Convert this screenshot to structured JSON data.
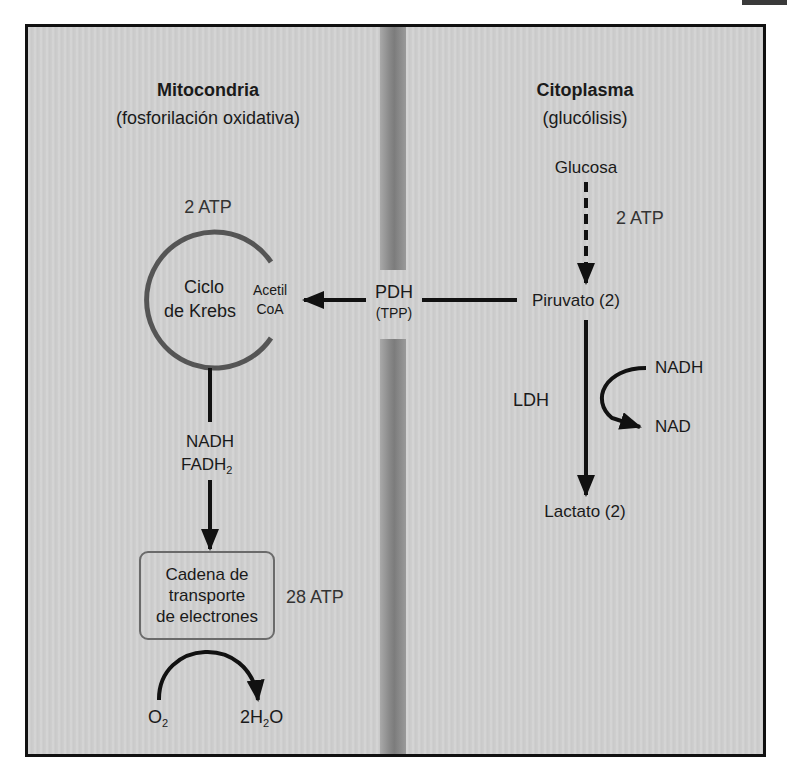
{
  "compartments": {
    "mitochondria": {
      "title": "Mitocondria",
      "subtitle": "(fosforilación oxidativa)"
    },
    "cytoplasm": {
      "title": "Citoplasma",
      "subtitle": "(glucólisis)"
    }
  },
  "krebs": {
    "atp": "2 ATP",
    "label_line1": "Ciclo",
    "label_line2": "de Krebs",
    "acetyl_line1": "Acetil",
    "acetyl_line2": "CoA"
  },
  "pdh": {
    "enzyme": "PDH",
    "cofactor": "(TPP)"
  },
  "glycolysis": {
    "glucose": "Glucosa",
    "atp": "2 ATP",
    "pyruvate": "Piruvato (2)",
    "ldh": "LDH",
    "nadh": "NADH",
    "nad": "NAD",
    "lactate": "Lactato (2)"
  },
  "oxphos": {
    "carrier1": "NADH",
    "carrier2_base": "FADH",
    "carrier2_sub": "2",
    "etc_line1": "Cadena de",
    "etc_line2": "transporte",
    "etc_line3": "de electrones",
    "atp": "28 ATP",
    "o2_base": "O",
    "o2_sub": "2",
    "water_pre": "2H",
    "water_sub": "2",
    "water_post": "O"
  },
  "colors": {
    "background": "#cfcfcf",
    "frame": "#111111",
    "membrane": "#8a8a8a",
    "krebs_circle": "#555555",
    "arrows": "#111111"
  }
}
